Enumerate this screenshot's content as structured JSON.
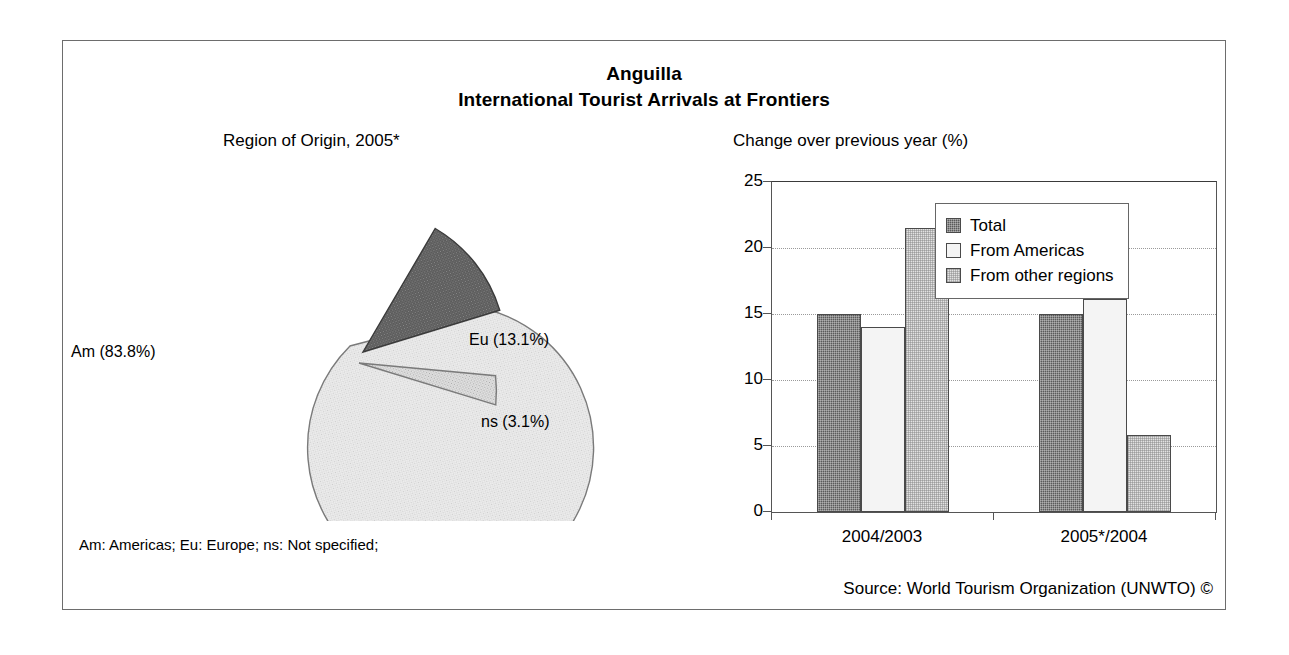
{
  "figure": {
    "title": "Anguilla",
    "subtitle": "International Tourist Arrivals at Frontiers",
    "abbreviation_note": "Am: Americas; Eu: Europe; ns: Not specified;",
    "source": "Source: World Tourism Organization (UNWTO) ©",
    "border_color": "#6d6d6d"
  },
  "pie_panel": {
    "caption": "Region of Origin, 2005*",
    "labels": {
      "am": "Am (83.8%)",
      "eu": "Eu (13.1%)",
      "ns": "ns (3.1%)"
    }
  },
  "bar_panel": {
    "caption": "Change over previous year (%)",
    "legend": {
      "items": [
        {
          "label": "Total",
          "color": "#5a5a5a"
        },
        {
          "label": "From Americas",
          "color": "#f4f4f4"
        },
        {
          "label": "From other regions",
          "color": "#e2e2e2"
        }
      ]
    },
    "y_ticks": [
      "0",
      "5",
      "10",
      "15",
      "20",
      "25"
    ],
    "x_ticks": [
      "2004/2003",
      "2005*/2004"
    ]
  },
  "chart_data": [
    {
      "type": "pie",
      "title": "Region of Origin, 2005*",
      "labels": [
        "Am",
        "Eu",
        "ns"
      ],
      "values": [
        83.8,
        13.1,
        3.1
      ],
      "display_labels": [
        "Am (83.8%)",
        "Eu (13.1%)",
        "ns (3.1%)"
      ],
      "units": "percent",
      "exploded": [
        false,
        true,
        true
      ],
      "colors": [
        "#eeeeee",
        "#5a5a5a",
        "#e2e2e2"
      ],
      "legend": "none",
      "annotations": [
        "Am: Americas; Eu: Europe; ns: Not specified;"
      ]
    },
    {
      "type": "bar",
      "title": "Change over previous year (%)",
      "categories": [
        "2004/2003",
        "2005*/2004"
      ],
      "series": [
        {
          "name": "Total",
          "values": [
            15.0,
            15.0
          ],
          "color": "#5a5a5a"
        },
        {
          "name": "From Americas",
          "values": [
            14.0,
            16.1
          ],
          "color": "#f4f4f4"
        },
        {
          "name": "From other regions",
          "values": [
            21.5,
            5.8
          ],
          "color": "#e2e2e2"
        }
      ],
      "xlabel": "",
      "ylabel": "",
      "ylim": [
        0,
        25
      ],
      "ytick_step": 5,
      "grid": true,
      "legend_position": "top-right"
    }
  ]
}
